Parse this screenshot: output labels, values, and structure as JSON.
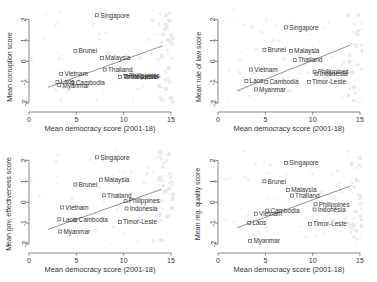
{
  "figure": {
    "background_color": "#ffffff",
    "layout": "2x2 grid of scatter plots",
    "marker_color": "#4a4a4a",
    "fitline_color": "#6e6e6e"
  },
  "chart_data": [
    {
      "type": "scatter",
      "title": "",
      "panel_index": 0,
      "xlabel": "Mean democracy score (2001-18)",
      "ylabel": "Mean corruption score",
      "xlim": [
        0,
        15
      ],
      "ylim": [
        -2,
        2.5
      ],
      "xticks": [
        "0",
        "5",
        "10",
        "15"
      ],
      "xtick_values": [
        0,
        5,
        10,
        15
      ],
      "yticks": [
        "2",
        "1",
        "0",
        "-1",
        "-2"
      ],
      "ytick_values": [
        2,
        1,
        0,
        -1,
        -2
      ],
      "grid": false,
      "legend": "none",
      "points": [
        {
          "label": "Singapore",
          "x": 7.2,
          "y": 2.2
        },
        {
          "label": "Brunei",
          "x": 4.9,
          "y": 0.5
        },
        {
          "label": "Malaysia",
          "x": 7.7,
          "y": 0.15
        },
        {
          "label": "Thailand",
          "x": 8.0,
          "y": -0.4
        },
        {
          "label": "Vietnam",
          "x": 3.4,
          "y": -0.6
        },
        {
          "label": "Philippines",
          "x": 10.2,
          "y": -0.7
        },
        {
          "label": "Indonesia",
          "x": 10.4,
          "y": -0.75
        },
        {
          "label": "Timor-Leste",
          "x": 9.6,
          "y": -0.75
        },
        {
          "label": "Laos",
          "x": 3.0,
          "y": -1.0
        },
        {
          "label": "Cambodia",
          "x": 4.6,
          "y": -1.05
        },
        {
          "label": "Myanmar",
          "x": 3.2,
          "y": -1.15
        }
      ],
      "fitline": {
        "x0": 2.0,
        "y0": -1.25,
        "x1": 14.0,
        "y1": 0.72
      }
    },
    {
      "type": "scatter",
      "title": "",
      "panel_index": 1,
      "xlabel": "Mean democracy score (2001-18)",
      "ylabel": "Mean rule of law score",
      "xlim": [
        0,
        15
      ],
      "ylim": [
        -2,
        2.5
      ],
      "xticks": [
        "0",
        "5",
        "10",
        "15"
      ],
      "xtick_values": [
        0,
        5,
        10,
        15
      ],
      "yticks": [
        "2",
        "1",
        "0",
        "-1",
        "-2"
      ],
      "ytick_values": [
        2,
        1,
        0,
        -1,
        -2
      ],
      "grid": false,
      "legend": "none",
      "points": [
        {
          "label": "Singapore",
          "x": 7.2,
          "y": 1.62
        },
        {
          "label": "Brunei",
          "x": 4.9,
          "y": 0.55
        },
        {
          "label": "Malaysia",
          "x": 7.7,
          "y": 0.5
        },
        {
          "label": "Thailand",
          "x": 8.1,
          "y": 0.05
        },
        {
          "label": "Vietnam",
          "x": 3.5,
          "y": -0.4
        },
        {
          "label": "Philippines",
          "x": 10.2,
          "y": -0.5
        },
        {
          "label": "Indonesia",
          "x": 10.4,
          "y": -0.6
        },
        {
          "label": "Laos",
          "x": 3.0,
          "y": -0.95
        },
        {
          "label": "Cambodia",
          "x": 5.1,
          "y": -1.0
        },
        {
          "label": "Timor-Leste",
          "x": 9.6,
          "y": -1.0
        },
        {
          "label": "Myanmar",
          "x": 4.0,
          "y": -1.35
        }
      ],
      "fitline": {
        "x0": 2.0,
        "y0": -1.42,
        "x1": 14.0,
        "y1": 0.78
      }
    },
    {
      "type": "scatter",
      "title": "",
      "panel_index": 2,
      "xlabel": "Mean democracy score (2001-18)",
      "ylabel": "Mean gov. effectiveness score",
      "xlim": [
        0,
        15
      ],
      "ylim": [
        -2,
        2.5
      ],
      "xticks": [
        "0",
        "5",
        "10",
        "15"
      ],
      "xtick_values": [
        0,
        5,
        10,
        15
      ],
      "yticks": [
        "2",
        "1",
        "0",
        "-1",
        "-2"
      ],
      "ytick_values": [
        2,
        1,
        0,
        -1,
        -2
      ],
      "grid": false,
      "legend": "none",
      "points": [
        {
          "label": "Singapore",
          "x": 7.2,
          "y": 2.15
        },
        {
          "label": "Malaysia",
          "x": 7.6,
          "y": 1.08
        },
        {
          "label": "Brunei",
          "x": 4.9,
          "y": 0.85
        },
        {
          "label": "Thailand",
          "x": 7.9,
          "y": 0.33
        },
        {
          "label": "Philippines",
          "x": 10.2,
          "y": 0.05
        },
        {
          "label": "Vietnam",
          "x": 3.5,
          "y": -0.25
        },
        {
          "label": "Indonesia",
          "x": 10.3,
          "y": -0.3
        },
        {
          "label": "Laos",
          "x": 3.2,
          "y": -0.82
        },
        {
          "label": "Cambodia",
          "x": 4.9,
          "y": -0.85
        },
        {
          "label": "Timor-Leste",
          "x": 9.6,
          "y": -0.95
        },
        {
          "label": "Myanmar",
          "x": 3.3,
          "y": -1.4
        }
      ],
      "fitline": {
        "x0": 2.0,
        "y0": -1.3,
        "x1": 14.0,
        "y1": 0.62
      }
    },
    {
      "type": "scatter",
      "title": "",
      "panel_index": 3,
      "xlabel": "Mean democracy score (2001-18)",
      "ylabel": "Mean reg. quality score",
      "xlim": [
        0,
        15
      ],
      "ylim": [
        -2,
        2.5
      ],
      "xticks": [
        "0",
        "5",
        "10",
        "15"
      ],
      "xtick_values": [
        0,
        5,
        10,
        15
      ],
      "yticks": [
        "2",
        "1",
        "0",
        "-1",
        "-2"
      ],
      "ytick_values": [
        2,
        1,
        0,
        -1,
        -2
      ],
      "grid": false,
      "legend": "none",
      "points": [
        {
          "label": "Singapore",
          "x": 7.2,
          "y": 1.88
        },
        {
          "label": "Brunei",
          "x": 4.9,
          "y": 1.0
        },
        {
          "label": "Malaysia",
          "x": 7.4,
          "y": 0.58
        },
        {
          "label": "Thailand",
          "x": 7.8,
          "y": 0.32
        },
        {
          "label": "Philippines",
          "x": 10.3,
          "y": -0.1
        },
        {
          "label": "Indonesia",
          "x": 10.2,
          "y": -0.35
        },
        {
          "label": "Cambodia",
          "x": 5.2,
          "y": -0.4
        },
        {
          "label": "Vietnam",
          "x": 4.0,
          "y": -0.55
        },
        {
          "label": "Laos",
          "x": 3.3,
          "y": -1.0
        },
        {
          "label": "Timor-Leste",
          "x": 9.7,
          "y": -1.05
        },
        {
          "label": "Myanmar",
          "x": 3.4,
          "y": -1.85
        }
      ],
      "fitline": {
        "x0": 2.0,
        "y0": -1.22,
        "x1": 14.0,
        "y1": 0.78
      }
    }
  ]
}
